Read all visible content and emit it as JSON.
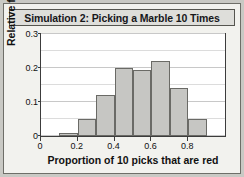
{
  "chart_data": {
    "type": "bar",
    "title": "Simulation 2: Picking a Marble 10 Times",
    "xlabel": "Proportion of 10 picks that are red",
    "ylabel": "Relative frequency",
    "categories": [
      "0.0",
      "0.1",
      "0.2",
      "0.3",
      "0.4",
      "0.5",
      "0.6",
      "0.7",
      "0.8",
      "0.9"
    ],
    "bin_starts": [
      0.0,
      0.1,
      0.2,
      0.3,
      0.4,
      0.5,
      0.6,
      0.7,
      0.8,
      0.9
    ],
    "bin_width": 0.1,
    "values": [
      0,
      0.01,
      0.05,
      0.12,
      0.2,
      0.195,
      0.22,
      0.14,
      0.05,
      0
    ],
    "xlim": [
      0,
      1.0
    ],
    "ylim": [
      0,
      0.3
    ],
    "xticks": [
      "0",
      "0.2",
      "0.4",
      "0.6",
      "0.8"
    ],
    "xtick_values": [
      0,
      0.2,
      0.4,
      0.6,
      0.8
    ],
    "yticks": [
      "0",
      "0.1",
      "0.2",
      "0.3"
    ],
    "ytick_values": [
      0,
      0.1,
      0.2,
      0.3
    ],
    "minor_gridline_step": 0.05,
    "grid": true,
    "legend": false,
    "bar_color": "#c6c6c3",
    "bar_edge_color": "#6a6a66",
    "plot_background": "#ffffff",
    "panel_background": "#f2f2ee",
    "frame_color": "#c9c9c4"
  }
}
